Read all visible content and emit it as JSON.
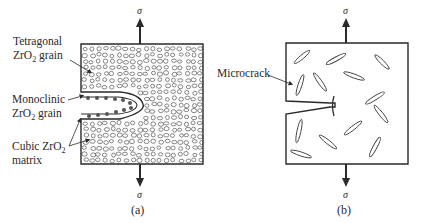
{
  "panel_a": {
    "caption": "(a)",
    "stress_top": "σ",
    "stress_bottom": "σ",
    "labels": {
      "tetragonal_line1": "Tetragonal",
      "tetragonal_line2_prefix": "ZrO",
      "tetragonal_line2_sub": "2",
      "tetragonal_line2_suffix": " grain",
      "monoclinic_line1": "Monoclinic",
      "monoclinic_line2_prefix": "ZrO",
      "monoclinic_line2_sub": "2",
      "monoclinic_line2_suffix": " grain",
      "cubic_line1_prefix": "Cubic ZrO",
      "cubic_line1_sub": "2",
      "cubic_line2": "matrix"
    }
  },
  "panel_b": {
    "caption": "(b)",
    "stress_top": "σ",
    "stress_bottom": "σ",
    "labels": {
      "microcrack": "Microcrack"
    }
  },
  "colors": {
    "line": "#2a2a2a",
    "background": "#ffffff",
    "dots": "#555555"
  }
}
